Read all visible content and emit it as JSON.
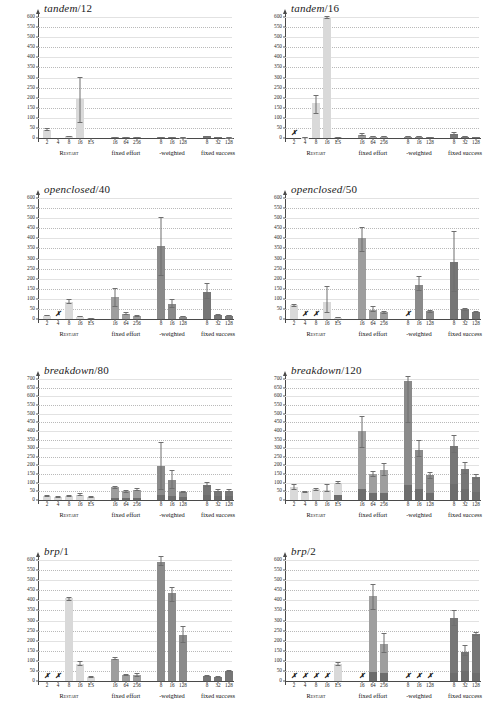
{
  "figure": {
    "columns": 2,
    "rows": 4,
    "group_labels": [
      "Restart",
      "fixed effort",
      "-weighted",
      "fixed success"
    ],
    "x_categories": [
      "2",
      "4",
      "8",
      "16",
      "ES",
      "16",
      "64",
      "256",
      "8",
      "16",
      "128",
      "8",
      "32",
      "128"
    ],
    "colors": {
      "restart": "#d9d9d9",
      "fixed_effort": "#9e9e9e",
      "weighted": "#8a8a8a",
      "fixed_success": "#767676",
      "base_segment": "#6d6d6d",
      "error_bar": "#6e6e6e",
      "grid": "#b9b9b9",
      "axis": "#4a4a4a"
    },
    "missing_marker": "✗"
  },
  "chart_data": [
    {
      "type": "bar",
      "title": "tandem/12",
      "title_model": "tandem",
      "title_param": "/12",
      "ylim": [
        0,
        600
      ],
      "ystep": 50,
      "yticks": [
        0,
        50,
        100,
        150,
        200,
        250,
        300,
        350,
        400,
        450,
        500,
        550,
        600
      ],
      "xlabel": "",
      "ylabel": "",
      "grid": true,
      "categories": [
        "2",
        "4",
        "8",
        "16",
        "ES",
        "16",
        "64",
        "256",
        "8",
        "16",
        "128",
        "8",
        "32",
        "128"
      ],
      "groups": [
        "Restart",
        "Restart",
        "Restart",
        "Restart",
        "Restart",
        "fixed effort",
        "fixed effort",
        "fixed effort",
        "-weighted",
        "-weighted",
        "-weighted",
        "fixed success",
        "fixed success",
        "fixed success"
      ],
      "values": [
        42,
        0,
        9,
        192,
        0,
        4,
        3,
        3,
        3,
        3,
        2,
        8,
        3,
        2
      ],
      "base_values": [
        0,
        0,
        0,
        0,
        0,
        0,
        0,
        0,
        0,
        0,
        0,
        0,
        0,
        0
      ],
      "err_low": [
        37,
        0,
        7,
        75,
        0,
        2,
        2,
        2,
        2,
        2,
        1,
        5,
        2,
        1
      ],
      "err_high": [
        48,
        0,
        11,
        305,
        0,
        7,
        5,
        5,
        5,
        5,
        4,
        12,
        5,
        4
      ],
      "missing": []
    },
    {
      "type": "bar",
      "title": "tandem/16",
      "title_model": "tandem",
      "title_param": "/16",
      "ylim": [
        0,
        600
      ],
      "ystep": 50,
      "yticks": [
        0,
        50,
        100,
        150,
        200,
        250,
        300,
        350,
        400,
        450,
        500,
        550,
        600
      ],
      "xlabel": "",
      "ylabel": "",
      "grid": true,
      "categories": [
        "2",
        "4",
        "8",
        "16",
        "ES",
        "16",
        "64",
        "256",
        "8",
        "16",
        "128",
        "8",
        "32",
        "128"
      ],
      "groups": [
        "Restart",
        "Restart",
        "Restart",
        "Restart",
        "Restart",
        "fixed effort",
        "fixed effort",
        "fixed effort",
        "-weighted",
        "-weighted",
        "-weighted",
        "fixed success",
        "fixed success",
        "fixed success"
      ],
      "values": [
        0,
        2,
        175,
        597,
        3,
        17,
        6,
        5,
        7,
        5,
        3,
        20,
        6,
        4
      ],
      "base_values": [
        0,
        0,
        0,
        0,
        0,
        0,
        0,
        0,
        0,
        0,
        0,
        0,
        0,
        0
      ],
      "err_low": [
        0,
        1,
        120,
        590,
        2,
        12,
        4,
        3,
        4,
        3,
        2,
        13,
        4,
        2
      ],
      "err_high": [
        0,
        3,
        212,
        604,
        5,
        23,
        9,
        7,
        11,
        8,
        5,
        28,
        9,
        6
      ],
      "missing": [
        "2"
      ]
    },
    {
      "type": "bar",
      "title": "openclosed/40",
      "title_model": "openclosed",
      "title_param": "/40",
      "ylim": [
        0,
        600
      ],
      "ystep": 50,
      "yticks": [
        0,
        50,
        100,
        150,
        200,
        250,
        300,
        350,
        400,
        450,
        500,
        550,
        600
      ],
      "xlabel": "",
      "ylabel": "",
      "grid": true,
      "categories": [
        "2",
        "4",
        "8",
        "16",
        "ES",
        "16",
        "64",
        "256",
        "8",
        "16",
        "128",
        "8",
        "32",
        "128"
      ],
      "groups": [
        "Restart",
        "Restart",
        "Restart",
        "Restart",
        "Restart",
        "fixed effort",
        "fixed effort",
        "fixed effort",
        "-weighted",
        "-weighted",
        "-weighted",
        "fixed success",
        "fixed success",
        "fixed success"
      ],
      "values": [
        16,
        0,
        86,
        11,
        3,
        107,
        26,
        16,
        362,
        73,
        12,
        135,
        19,
        17
      ],
      "base_values": [
        0,
        0,
        0,
        0,
        0,
        0,
        0,
        0,
        0,
        0,
        0,
        0,
        0,
        0
      ],
      "err_low": [
        13,
        0,
        72,
        8,
        2,
        62,
        18,
        12,
        215,
        53,
        9,
        98,
        14,
        13
      ],
      "err_high": [
        20,
        0,
        100,
        15,
        4,
        155,
        35,
        21,
        508,
        98,
        16,
        177,
        25,
        22
      ],
      "missing": [
        "4"
      ]
    },
    {
      "type": "bar",
      "title": "openclosed/50",
      "title_model": "openclosed",
      "title_param": "/50",
      "ylim": [
        0,
        600
      ],
      "ystep": 50,
      "yticks": [
        0,
        50,
        100,
        150,
        200,
        250,
        300,
        350,
        400,
        450,
        500,
        550,
        600
      ],
      "xlabel": "",
      "ylabel": "",
      "grid": true,
      "categories": [
        "2",
        "4",
        "8",
        "16",
        "ES",
        "16",
        "64",
        "256",
        "8",
        "16",
        "128",
        "8",
        "32",
        "128"
      ],
      "groups": [
        "Restart",
        "Restart",
        "Restart",
        "Restart",
        "Restart",
        "fixed effort",
        "fixed effort",
        "fixed effort",
        "-weighted",
        "-weighted",
        "-weighted",
        "fixed success",
        "fixed success",
        "fixed success"
      ],
      "values": [
        70,
        0,
        0,
        86,
        5,
        403,
        47,
        33,
        0,
        168,
        38,
        285,
        48,
        35
      ],
      "base_values": [
        0,
        0,
        0,
        0,
        0,
        0,
        0,
        0,
        0,
        0,
        0,
        0,
        0,
        0
      ],
      "err_low": [
        62,
        0,
        0,
        30,
        3,
        332,
        35,
        26,
        0,
        140,
        29,
        133,
        38,
        28
      ],
      "err_high": [
        76,
        0,
        0,
        165,
        7,
        455,
        66,
        40,
        0,
        212,
        47,
        437,
        57,
        42
      ],
      "missing": [
        "4",
        "8",
        "8w"
      ]
    },
    {
      "type": "bar",
      "title": "breakdown/80",
      "title_model": "breakdown",
      "title_param": "/80",
      "ylim": [
        0,
        700
      ],
      "ystep": 50,
      "yticks": [
        0,
        50,
        100,
        150,
        200,
        250,
        300,
        350,
        400,
        450,
        500,
        550,
        600,
        650,
        700
      ],
      "xlabel": "",
      "ylabel": "",
      "grid": true,
      "categories": [
        "2",
        "4",
        "8",
        "16",
        "ES",
        "16",
        "64",
        "256",
        "8",
        "16",
        "128",
        "8",
        "32",
        "128"
      ],
      "groups": [
        "Restart",
        "Restart",
        "Restart",
        "Restart",
        "Restart",
        "fixed effort",
        "fixed effort",
        "fixed effort",
        "-weighted",
        "-weighted",
        "-weighted",
        "fixed success",
        "fixed success",
        "fixed success"
      ],
      "values": [
        21,
        18,
        22,
        29,
        16,
        73,
        50,
        60,
        198,
        115,
        44,
        89,
        55,
        55
      ],
      "base_values": [
        0,
        0,
        0,
        0,
        0,
        12,
        12,
        14,
        30,
        22,
        16,
        30,
        22,
        22
      ],
      "err_low": [
        15,
        13,
        17,
        22,
        12,
        66,
        42,
        53,
        60,
        62,
        38,
        74,
        48,
        48
      ],
      "err_high": [
        30,
        24,
        28,
        38,
        21,
        81,
        59,
        68,
        338,
        172,
        51,
        105,
        62,
        62
      ],
      "missing": []
    },
    {
      "type": "bar",
      "title": "breakdown/120",
      "title_model": "breakdown",
      "title_param": "/120",
      "ylim": [
        0,
        700
      ],
      "ystep": 50,
      "yticks": [
        0,
        50,
        100,
        150,
        200,
        250,
        300,
        350,
        400,
        450,
        500,
        550,
        600,
        650,
        700
      ],
      "xlabel": "",
      "ylabel": "",
      "grid": true,
      "categories": [
        "2",
        "4",
        "8",
        "16",
        "ES",
        "16",
        "64",
        "256",
        "8",
        "16",
        "128",
        "8",
        "32",
        "128"
      ],
      "groups": [
        "Restart",
        "Restart",
        "Restart",
        "Restart",
        "Restart",
        "fixed effort",
        "fixed effort",
        "fixed effort",
        "-weighted",
        "-weighted",
        "-weighted",
        "fixed success",
        "fixed success",
        "fixed success"
      ],
      "values": [
        75,
        45,
        62,
        60,
        100,
        400,
        152,
        175,
        688,
        288,
        142,
        312,
        182,
        135
      ],
      "base_values": [
        0,
        0,
        0,
        0,
        30,
        62,
        38,
        42,
        88,
        62,
        42,
        92,
        62,
        48
      ],
      "err_low": [
        60,
        38,
        55,
        48,
        92,
        302,
        136,
        140,
        448,
        250,
        120,
        272,
        152,
        122
      ],
      "err_high": [
        90,
        52,
        70,
        92,
        108,
        488,
        168,
        215,
        715,
        348,
        165,
        378,
        222,
        150
      ],
      "missing": []
    },
    {
      "type": "bar",
      "title": "brp/1",
      "title_model": "brp",
      "title_param": "/1",
      "ylim": [
        0,
        600
      ],
      "ystep": 50,
      "yticks": [
        0,
        50,
        100,
        150,
        200,
        250,
        300,
        350,
        400,
        450,
        500,
        550,
        600
      ],
      "xlabel": "",
      "ylabel": "",
      "grid": true,
      "categories": [
        "2",
        "4",
        "8",
        "16",
        "ES",
        "16",
        "64",
        "256",
        "8",
        "16",
        "128",
        "8",
        "32",
        "128"
      ],
      "groups": [
        "Restart",
        "Restart",
        "Restart",
        "Restart",
        "Restart",
        "fixed effort",
        "fixed effort",
        "fixed effort",
        "-weighted",
        "-weighted",
        "-weighted",
        "fixed success",
        "fixed success",
        "fixed success"
      ],
      "values": [
        0,
        0,
        410,
        85,
        20,
        110,
        30,
        30,
        588,
        435,
        228,
        26,
        21,
        50
      ],
      "base_values": [
        0,
        0,
        0,
        0,
        0,
        0,
        0,
        0,
        0,
        0,
        0,
        0,
        0,
        0
      ],
      "err_low": [
        0,
        0,
        398,
        72,
        16,
        102,
        24,
        22,
        572,
        392,
        190,
        20,
        16,
        45
      ],
      "err_high": [
        0,
        0,
        418,
        100,
        24,
        118,
        36,
        40,
        618,
        468,
        272,
        32,
        27,
        55
      ],
      "missing": [
        "2",
        "4"
      ]
    },
    {
      "type": "bar",
      "title": "brp/2",
      "title_model": "brp",
      "title_param": "/2",
      "ylim": [
        0,
        600
      ],
      "ystep": 50,
      "yticks": [
        0,
        50,
        100,
        150,
        200,
        250,
        300,
        350,
        400,
        450,
        500,
        550,
        600
      ],
      "xlabel": "",
      "ylabel": "",
      "grid": true,
      "categories": [
        "2",
        "4",
        "8",
        "16",
        "ES",
        "16",
        "64",
        "256",
        "8",
        "16",
        "128",
        "8",
        "32",
        "128"
      ],
      "groups": [
        "Restart",
        "Restart",
        "Restart",
        "Restart",
        "Restart",
        "fixed effort",
        "fixed effort",
        "fixed effort",
        "-weighted",
        "-weighted",
        "-weighted",
        "fixed success",
        "fixed success",
        "fixed success"
      ],
      "values": [
        0,
        0,
        0,
        0,
        82,
        0,
        422,
        186,
        0,
        0,
        0,
        310,
        142,
        235
      ],
      "base_values": [
        0,
        0,
        0,
        0,
        0,
        0,
        45,
        40,
        0,
        0,
        0,
        42,
        48,
        38
      ],
      "err_low": [
        0,
        0,
        0,
        0,
        74,
        0,
        352,
        140,
        0,
        0,
        0,
        272,
        125,
        222
      ],
      "err_high": [
        0,
        0,
        0,
        0,
        92,
        0,
        482,
        238,
        0,
        0,
        0,
        352,
        178,
        245
      ],
      "missing": [
        "2",
        "4",
        "8",
        "16",
        "16f",
        "8w",
        "16w",
        "128w"
      ]
    }
  ]
}
